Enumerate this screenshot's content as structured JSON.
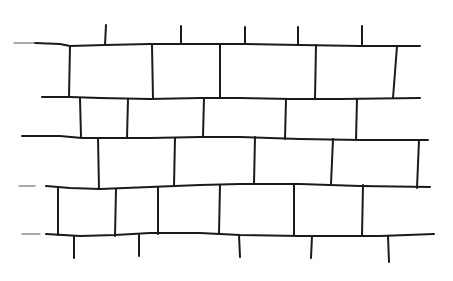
{
  "image": {
    "subject": "brick-wall-sketch",
    "background": "#ffffff",
    "ink": "#1a1a1a"
  },
  "courses": [
    {
      "name": "course-1",
      "pts": [
        [
          35,
          43
        ],
        [
          60,
          44
        ],
        [
          70,
          46
        ],
        [
          105,
          45
        ],
        [
          150,
          44
        ],
        [
          180,
          44
        ],
        [
          245,
          44
        ],
        [
          300,
          45
        ],
        [
          360,
          46
        ],
        [
          420,
          46
        ]
      ]
    },
    {
      "name": "course-2",
      "pts": [
        [
          42,
          97
        ],
        [
          70,
          97
        ],
        [
          100,
          98
        ],
        [
          150,
          99
        ],
        [
          200,
          98
        ],
        [
          240,
          98
        ],
        [
          290,
          99
        ],
        [
          340,
          99
        ],
        [
          420,
          98
        ]
      ]
    },
    {
      "name": "course-3",
      "pts": [
        [
          22,
          136
        ],
        [
          60,
          136
        ],
        [
          82,
          138
        ],
        [
          150,
          138
        ],
        [
          200,
          137
        ],
        [
          240,
          137
        ],
        [
          300,
          139
        ],
        [
          360,
          140
        ],
        [
          428,
          140
        ]
      ]
    },
    {
      "name": "course-4",
      "pts": [
        [
          46,
          186
        ],
        [
          70,
          188
        ],
        [
          100,
          189
        ],
        [
          150,
          187
        ],
        [
          200,
          185
        ],
        [
          240,
          184
        ],
        [
          300,
          184
        ],
        [
          360,
          186
        ],
        [
          430,
          187
        ]
      ]
    },
    {
      "name": "course-5",
      "pts": [
        [
          46,
          234
        ],
        [
          80,
          236
        ],
        [
          115,
          235
        ],
        [
          150,
          233
        ],
        [
          200,
          233
        ],
        [
          240,
          235
        ],
        [
          300,
          236
        ],
        [
          380,
          236
        ],
        [
          434,
          234
        ]
      ]
    }
  ],
  "stubs_left": [
    {
      "name": "stub-left-1",
      "x1": 14,
      "y1": 43,
      "x2": 35,
      "y2": 43
    },
    {
      "name": "stub-left-2",
      "x1": 19,
      "y1": 186,
      "x2": 35,
      "y2": 186
    },
    {
      "name": "stub-left-3",
      "x1": 22,
      "y1": 234,
      "x2": 40,
      "y2": 234
    }
  ],
  "joints": [
    {
      "name": "top-post-1",
      "x1": 106,
      "y1": 25,
      "x2": 105,
      "y2": 45
    },
    {
      "name": "top-post-2",
      "x1": 181,
      "y1": 26,
      "x2": 181,
      "y2": 44
    },
    {
      "name": "top-post-3",
      "x1": 245,
      "y1": 27,
      "x2": 245,
      "y2": 44
    },
    {
      "name": "top-post-4",
      "x1": 298,
      "y1": 27,
      "x2": 298,
      "y2": 44
    },
    {
      "name": "top-post-5",
      "x1": 362,
      "y1": 26,
      "x2": 362,
      "y2": 46
    },
    {
      "name": "row1-joint-1",
      "x1": 70,
      "y1": 46,
      "x2": 69,
      "y2": 97
    },
    {
      "name": "row1-joint-2",
      "x1": 152,
      "y1": 45,
      "x2": 153,
      "y2": 99
    },
    {
      "name": "row1-joint-3",
      "x1": 220,
      "y1": 44,
      "x2": 220,
      "y2": 98
    },
    {
      "name": "row1-joint-4",
      "x1": 316,
      "y1": 45,
      "x2": 315,
      "y2": 99
    },
    {
      "name": "row1-joint-5",
      "x1": 397,
      "y1": 46,
      "x2": 393,
      "y2": 98
    },
    {
      "name": "row2-joint-1",
      "x1": 80,
      "y1": 98,
      "x2": 81,
      "y2": 137
    },
    {
      "name": "row2-joint-2",
      "x1": 128,
      "y1": 99,
      "x2": 127,
      "y2": 138
    },
    {
      "name": "row2-joint-3",
      "x1": 204,
      "y1": 98,
      "x2": 203,
      "y2": 137
    },
    {
      "name": "row2-joint-4",
      "x1": 286,
      "y1": 99,
      "x2": 285,
      "y2": 139
    },
    {
      "name": "row2-joint-5",
      "x1": 357,
      "y1": 99,
      "x2": 356,
      "y2": 140
    },
    {
      "name": "row3-joint-1",
      "x1": 98,
      "y1": 138,
      "x2": 99,
      "y2": 189
    },
    {
      "name": "row3-joint-2",
      "x1": 175,
      "y1": 138,
      "x2": 174,
      "y2": 186
    },
    {
      "name": "row3-joint-3",
      "x1": 255,
      "y1": 137,
      "x2": 254,
      "y2": 184
    },
    {
      "name": "row3-joint-4",
      "x1": 333,
      "y1": 139,
      "x2": 331,
      "y2": 184
    },
    {
      "name": "row3-joint-5",
      "x1": 419,
      "y1": 140,
      "x2": 417,
      "y2": 188
    },
    {
      "name": "row4-joint-1",
      "x1": 58,
      "y1": 187,
      "x2": 58,
      "y2": 235
    },
    {
      "name": "row4-joint-2",
      "x1": 116,
      "y1": 189,
      "x2": 115,
      "y2": 236
    },
    {
      "name": "row4-joint-3",
      "x1": 158,
      "y1": 187,
      "x2": 158,
      "y2": 234
    },
    {
      "name": "row4-joint-4",
      "x1": 220,
      "y1": 185,
      "x2": 219,
      "y2": 233
    },
    {
      "name": "row4-joint-5",
      "x1": 294,
      "y1": 184,
      "x2": 294,
      "y2": 235
    },
    {
      "name": "row4-joint-6",
      "x1": 363,
      "y1": 185,
      "x2": 362,
      "y2": 236
    },
    {
      "name": "bottom-post-1",
      "x1": 74,
      "y1": 236,
      "x2": 74,
      "y2": 258
    },
    {
      "name": "bottom-post-2",
      "x1": 139,
      "y1": 235,
      "x2": 139,
      "y2": 256
    },
    {
      "name": "bottom-post-3",
      "x1": 239,
      "y1": 235,
      "x2": 240,
      "y2": 257
    },
    {
      "name": "bottom-post-4",
      "x1": 312,
      "y1": 236,
      "x2": 311,
      "y2": 258
    },
    {
      "name": "bottom-post-5",
      "x1": 388,
      "y1": 236,
      "x2": 389,
      "y2": 262
    }
  ]
}
